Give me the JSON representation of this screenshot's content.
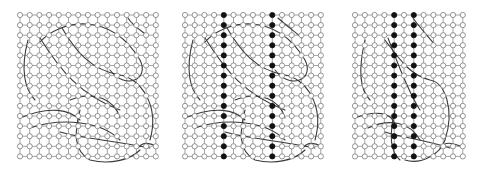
{
  "figure": {
    "colors": {
      "background": "#ffffff",
      "edge": "#9a9a9a",
      "node_empty_fill": "#ffffff",
      "node_stroke": "#7a7a7a",
      "node_filled": "#111111",
      "curve": "#3a3a3a"
    },
    "node_radius": 2.6,
    "panels": [
      {
        "id": "left",
        "origin": [
          20,
          15
        ],
        "spacing": [
          9.7,
          10.1
        ],
        "cols": 15,
        "rows": 15,
        "filled_columns": [],
        "curves": [
          "M40,42 C60,20 110,10 140,60 C150,80 125,90 110,70",
          "M62,28 C75,50 90,70 120,75 C140,78 160,105 150,140",
          "M128,18 C132,25 140,30 148,36",
          "M28,40 C20,70 25,90 35,100",
          "M40,38 C60,70 80,95 120,110",
          "M20,118 C50,105 70,110 80,120",
          "M80,110 C75,130 72,150 90,160 C110,165 130,160 140,150",
          "M30,128 C60,118 100,120 120,140",
          "M60,132 C80,138 110,140 150,148",
          "M70,100 C95,90 115,100 120,118",
          "M138,148 C143,141 150,143 156,146"
        ]
      },
      {
        "id": "middle",
        "origin": [
          185,
          15
        ],
        "spacing": [
          9.7,
          10.1
        ],
        "cols": 15,
        "rows": 15,
        "filled_columns": [
          4,
          9
        ],
        "curves": [
          "M205,42 C225,20 275,10 305,60 C315,80 290,90 275,70",
          "M227,28 C240,50 255,70 285,75 C305,78 325,105 315,140",
          "M278,18 C286,25 295,32 302,38",
          "M193,40 C185,70 190,90 200,100",
          "M205,38 C225,70 245,95 285,110",
          "M185,118 C215,105 235,110 245,120",
          "M245,110 C240,130 237,150 255,160 C275,165 295,160 305,150",
          "M195,128 C225,118 265,120 285,140",
          "M225,132 C245,138 275,140 315,148",
          "M235,100 C260,90 280,100 285,118",
          "M303,148 C308,141 315,143 321,146"
        ]
      },
      {
        "id": "right",
        "origin": [
          355,
          15
        ],
        "spacing": [
          9.8,
          10.1
        ],
        "cols": 12,
        "rows": 15,
        "filled_columns": [
          4,
          6
        ],
        "curves": [
          "M413,18 C420,28 428,36 435,45",
          "M385,40 C400,60 410,75 430,80 C445,82 455,110 445,140 C440,155 420,165 405,160",
          "M388,38 C400,70 410,95 420,110",
          "M365,40 C358,70 360,90 370,100",
          "M355,118 C375,110 392,112 395,125",
          "M395,110 C390,130 388,150 400,160",
          "M368,128 C390,118 410,122 420,140",
          "M385,132 C405,138 425,140 450,148",
          "M440,148 C445,141 452,143 460,146"
        ]
      }
    ]
  }
}
